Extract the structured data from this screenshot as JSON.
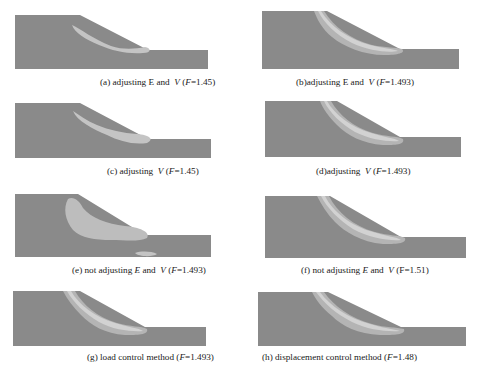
{
  "figure": {
    "colors": {
      "soil": "#8a8a8a",
      "band_outer": "#b4b4b4",
      "band_inner": "#cfcfcf",
      "caption_text": "#1a1a1a"
    },
    "panels": [
      {
        "id": "a",
        "label": "(a)",
        "text": "adjusting E and",
        "nu": "V",
        "F_label": "F",
        "F": "=1.45",
        "caption": "(a) adjusting E and  V (F=1.45)"
      },
      {
        "id": "b",
        "label": "(b)",
        "text": "adjusting E and",
        "nu": "V",
        "F_label": "F",
        "F": "=1.493",
        "caption": "(b)adjusting E and  V (F=1.493)"
      },
      {
        "id": "c",
        "label": "(c)",
        "text": "adjusting",
        "nu": "V",
        "F_label": "F",
        "F": "=1.45",
        "caption": "(c) adjusting  V (F=1.45)"
      },
      {
        "id": "d",
        "label": "(d)",
        "text": "adjusting",
        "nu": "V",
        "F_label": "F",
        "F": "=1.493",
        "caption": "(d)adjusting  V (F=1.493)"
      },
      {
        "id": "e",
        "label": "(e)",
        "text": "not adjusting",
        "E": "E",
        "and": "and",
        "nu": "V",
        "F_label": "F",
        "F": "=1.493",
        "caption": "(e) not adjusting E and  V (F=1.493)"
      },
      {
        "id": "f",
        "label": "(f)",
        "text": "not adjusting",
        "E": "E",
        "and": "and",
        "nu": "V",
        "F_label": "F",
        "F": "=1.51",
        "caption": "(f) not adjusting E and  V (F=1.51)"
      },
      {
        "id": "g",
        "label": "(g)",
        "text": "load control method",
        "F_label": "F",
        "F": "=1.493",
        "caption": "(g) load control method (F=1.493)"
      },
      {
        "id": "h",
        "label": "(h)",
        "text": "displacement control method",
        "F_label": "F",
        "F": "=1.48",
        "caption": "(h) displacement control method (F=1.48)"
      }
    ]
  }
}
